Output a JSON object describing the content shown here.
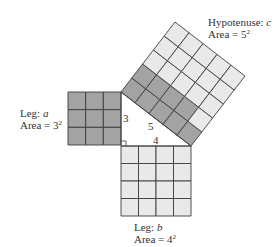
{
  "figure": {
    "colors": {
      "dark_fill": "#a3a3a3",
      "light_fill": "#e9e9e9",
      "stroke": "#3c3c3c",
      "background": "#ffffff"
    },
    "triangle": {
      "right_angle_vertex": [
        121,
        146
      ],
      "leg_a_top": [
        121,
        92
      ],
      "leg_b_right": [
        191,
        146
      ],
      "side_labels": {
        "a": "3",
        "b": "4",
        "c": "5"
      }
    },
    "square_a": {
      "origin": [
        68,
        92
      ],
      "size": 53,
      "grid": 3,
      "fill": "dark",
      "label_prefix": "Leg: ",
      "label_var": "a",
      "area_prefix": "Area = ",
      "area_base": "3",
      "area_exp": "2"
    },
    "square_b": {
      "origin": [
        121,
        146
      ],
      "size": 70,
      "grid": 4,
      "fill": "light",
      "label_prefix": "Leg: ",
      "label_var": "b",
      "area_prefix": "Area = ",
      "area_base": "4",
      "area_exp": "2"
    },
    "square_c": {
      "p0": [
        121,
        92
      ],
      "p1": [
        191,
        146
      ],
      "grid": 5,
      "dark_cells_per_row": [
        5,
        4,
        0,
        0,
        0
      ],
      "label_prefix": "Hypotenuse: ",
      "label_var": "c",
      "area_prefix": "Area = ",
      "area_base": "5",
      "area_exp": "2"
    }
  }
}
